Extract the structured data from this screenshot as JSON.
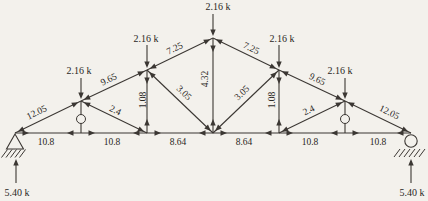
{
  "meta": {
    "background": "#f3f1ec",
    "ink_color": "#3b3733",
    "text_color": "#262320",
    "figure_kind": "truss-member-force-diagram"
  },
  "truss": {
    "nodes": {
      "L0": [
        15,
        133
      ],
      "L1": [
        81,
        133
      ],
      "L2": [
        147,
        133
      ],
      "L3": [
        213,
        133
      ],
      "L4": [
        279,
        133
      ],
      "L5": [
        345,
        133
      ],
      "L6": [
        411,
        133
      ],
      "U1": [
        81,
        101
      ],
      "U2": [
        147,
        70
      ],
      "U3": [
        213,
        38
      ],
      "U4": [
        279,
        70
      ],
      "U5": [
        345,
        101
      ]
    },
    "members": [
      {
        "from": "L0",
        "to": "U1",
        "label": "12.05",
        "state": "C",
        "lp": [
          38,
          115
        ],
        "lr": -26
      },
      {
        "from": "U1",
        "to": "U2",
        "label": "9.65",
        "state": "C",
        "lp": [
          110,
          82
        ],
        "lr": -26
      },
      {
        "from": "U2",
        "to": "U3",
        "label": "7.25",
        "state": "C",
        "lp": [
          176,
          51
        ],
        "lr": -26
      },
      {
        "from": "U3",
        "to": "U4",
        "label": "7.25",
        "state": "C",
        "lp": [
          250,
          51
        ],
        "lr": 26
      },
      {
        "from": "U4",
        "to": "U5",
        "label": "9.65",
        "state": "C",
        "lp": [
          316,
          82
        ],
        "lr": 26
      },
      {
        "from": "U5",
        "to": "L6",
        "label": "12.05",
        "state": "C",
        "lp": [
          388,
          115
        ],
        "lr": 26
      },
      {
        "from": "L0",
        "to": "L1",
        "label": "10.8",
        "state": "T",
        "lp": [
          46,
          145
        ],
        "lr": 0
      },
      {
        "from": "L1",
        "to": "L2",
        "label": "10.8",
        "state": "T",
        "lp": [
          112,
          145
        ],
        "lr": 0
      },
      {
        "from": "L2",
        "to": "L3",
        "label": "8.64",
        "state": "T",
        "lp": [
          178,
          145
        ],
        "lr": 0
      },
      {
        "from": "L3",
        "to": "L4",
        "label": "8.64",
        "state": "T",
        "lp": [
          244,
          145
        ],
        "lr": 0
      },
      {
        "from": "L4",
        "to": "L5",
        "label": "10.8",
        "state": "T",
        "lp": [
          310,
          145
        ],
        "lr": 0
      },
      {
        "from": "L5",
        "to": "L6",
        "label": "10.8",
        "state": "T",
        "lp": [
          378,
          145
        ],
        "lr": 0
      },
      {
        "from": "U1",
        "to": "L1",
        "label": "",
        "state": "Z"
      },
      {
        "from": "U2",
        "to": "L2",
        "label": "1.08",
        "state": "T",
        "lp": [
          146,
          100
        ],
        "lr": -90
      },
      {
        "from": "U3",
        "to": "L3",
        "label": "4.32",
        "state": "T",
        "lp": [
          208,
          79
        ],
        "lr": -90
      },
      {
        "from": "U4",
        "to": "L4",
        "label": "1.08",
        "state": "T",
        "lp": [
          275,
          100
        ],
        "lr": -90
      },
      {
        "from": "U5",
        "to": "L5",
        "label": "",
        "state": "Z"
      },
      {
        "from": "U1",
        "to": "L2",
        "label": "2.4",
        "state": "C",
        "lp": [
          114,
          113
        ],
        "lr": 26
      },
      {
        "from": "U2",
        "to": "L3",
        "label": "3.05",
        "state": "C",
        "lp": [
          182,
          95
        ],
        "lr": 44
      },
      {
        "from": "L3",
        "to": "U4",
        "label": "3.05",
        "state": "C",
        "lp": [
          244,
          95
        ],
        "lr": -44
      },
      {
        "from": "L4",
        "to": "U5",
        "label": "2.4",
        "state": "C",
        "lp": [
          310,
          113
        ],
        "lr": -26
      }
    ],
    "zero_force_markers": [
      [
        81,
        119
      ],
      [
        345,
        119
      ]
    ],
    "loads": [
      {
        "at": "U1",
        "label": "2.16 k",
        "label_pos": [
          79,
          74
        ],
        "line": [
          [
            81,
            78
          ],
          [
            81,
            97
          ]
        ]
      },
      {
        "at": "U2",
        "label": "2.16 k",
        "label_pos": [
          146,
          42
        ],
        "line": [
          [
            147,
            45
          ],
          [
            147,
            66
          ]
        ]
      },
      {
        "at": "U3",
        "label": "2.16 k",
        "label_pos": [
          218,
          10
        ],
        "line": [
          [
            213,
            14
          ],
          [
            213,
            34
          ]
        ]
      },
      {
        "at": "U4",
        "label": "2.16 k",
        "label_pos": [
          282,
          42
        ],
        "line": [
          [
            279,
            45
          ],
          [
            279,
            66
          ]
        ]
      },
      {
        "at": "U5",
        "label": "2.16 k",
        "label_pos": [
          340,
          74
        ],
        "line": [
          [
            345,
            78
          ],
          [
            345,
            97
          ]
        ]
      }
    ],
    "reactions": [
      {
        "at": "L0",
        "label": "5.40 k",
        "label_pos": [
          17,
          196
        ],
        "line": [
          [
            16,
            183
          ],
          [
            16,
            161
          ]
        ]
      },
      {
        "at": "L6",
        "label": "5.40 k",
        "label_pos": [
          412,
          196
        ],
        "line": [
          [
            411,
            183
          ],
          [
            411,
            161
          ]
        ]
      }
    ],
    "supports": [
      {
        "type": "pin",
        "node": "L0",
        "apex": [
          15,
          134
        ]
      },
      {
        "type": "roller",
        "node": "L6",
        "center": [
          411,
          141
        ]
      }
    ]
  }
}
